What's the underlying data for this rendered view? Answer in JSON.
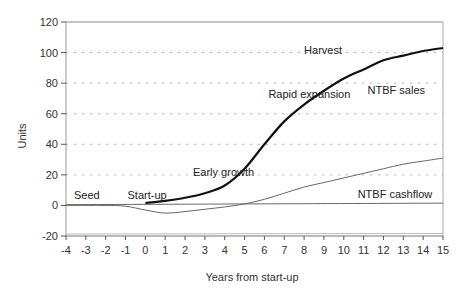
{
  "chart_data": {
    "type": "line",
    "title": "",
    "xlabel": "Years from start-up",
    "ylabel": "Units",
    "xlim": [
      -4,
      15
    ],
    "ylim": [
      -20,
      120
    ],
    "x_ticks": [
      -4,
      -3,
      -2,
      -1,
      0,
      1,
      2,
      3,
      4,
      5,
      6,
      7,
      8,
      9,
      10,
      11,
      12,
      13,
      14,
      15
    ],
    "y_ticks": [
      -20,
      0,
      20,
      40,
      60,
      80,
      100,
      120
    ],
    "grid": "horizontal dashed",
    "series": [
      {
        "name": "NTBF sales",
        "style": "thick black",
        "x": [
          0,
          1,
          2,
          3,
          4,
          5,
          6,
          7,
          8,
          9,
          10,
          11,
          12,
          13,
          14,
          15
        ],
        "values": [
          1.5,
          3,
          5,
          8,
          13,
          24,
          40,
          55,
          66,
          75,
          83,
          89,
          95,
          98,
          101,
          103
        ]
      },
      {
        "name": "NTBF cashflow",
        "style": "thin grey",
        "x": [
          -4,
          -3,
          -2,
          -1,
          0,
          1,
          2,
          3,
          4,
          5,
          6,
          7,
          8,
          9,
          10,
          11,
          12,
          13,
          14,
          15
        ],
        "values": [
          0,
          0,
          0,
          -0.5,
          -3,
          -5,
          -4,
          -2.5,
          -1,
          1,
          4,
          8,
          12,
          15,
          18,
          21,
          24,
          27,
          29,
          31
        ]
      },
      {
        "name": "Zero baseline",
        "style": "thin grey",
        "x": [
          -4,
          15
        ],
        "values": [
          0.5,
          1.5
        ]
      }
    ],
    "annotations": [
      {
        "text": "Seed",
        "x": -3.6,
        "y": 4
      },
      {
        "text": "Start-up",
        "x": -0.9,
        "y": 4
      },
      {
        "text": "Early growth",
        "x": 2.4,
        "y": 19
      },
      {
        "text": "Rapid expansion",
        "x": 6.2,
        "y": 70
      },
      {
        "text": "Harvest",
        "x": 8.0,
        "y": 99
      },
      {
        "text": "NTBF sales",
        "x": 11.2,
        "y": 73
      },
      {
        "text": "NTBF cashflow",
        "x": 10.7,
        "y": 5
      }
    ]
  },
  "labels": {
    "xlabel": "Years from start-up",
    "ylabel": "Units",
    "seed": "Seed",
    "startup": "Start-up",
    "early_growth": "Early growth",
    "rapid_expansion": "Rapid expansion",
    "harvest": "Harvest",
    "ntbf_sales": "NTBF sales",
    "ntbf_cashflow": "NTBF cashflow"
  }
}
